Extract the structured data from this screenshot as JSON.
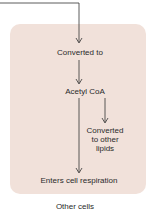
{
  "diagram": {
    "nodes": {
      "converted_to": "Converted to",
      "acetyl_coa": "Acetyl CoA",
      "converted_other_lipids_1": "Converted",
      "converted_other_lipids_2": "to other",
      "converted_other_lipids_3": "lipids",
      "enters_cell_respiration": "Enters cell respiration"
    },
    "caption": "Other cells",
    "colors": {
      "box_fill": "#f1e1da",
      "line": "#333333",
      "text": "#2a2a2a"
    }
  }
}
